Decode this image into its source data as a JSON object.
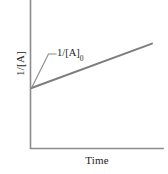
{
  "chart_data": {
    "type": "line",
    "title": "",
    "subtitle": "",
    "xlabel": "Time",
    "ylabel": "1/[A]",
    "xlim": [
      0,
      1
    ],
    "ylim": [
      0,
      1
    ],
    "grid": false,
    "legend": null,
    "axes_color": "#8c8c8c",
    "series": [
      {
        "name": "1/[A] vs Time",
        "color": "#7d7d7d",
        "x": [
          0,
          1
        ],
        "y": [
          0.45,
          0.78
        ],
        "intercept": 0.45,
        "slope": 0.33
      }
    ],
    "annotations": [
      {
        "name": "y-intercept-label",
        "text_main": "1/[A]",
        "text_sub": "0",
        "points_to_x": 0,
        "points_to_y": 0.45
      }
    ],
    "xticks": [],
    "yticks": [],
    "xticklabels": [],
    "yticklabels": []
  },
  "figure": {
    "background": "#ffffff",
    "axis_label_x": "Time",
    "axis_label_y": "1/[A]",
    "annotation_main": "1/[A]",
    "annotation_subscript": "0"
  }
}
